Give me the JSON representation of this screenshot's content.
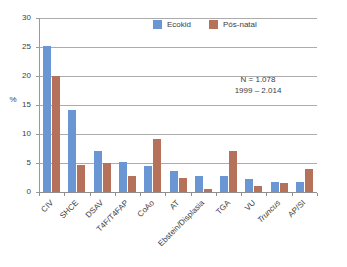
{
  "chart_data": {
    "type": "bar",
    "title": "",
    "subtitle": "",
    "xlabel": "",
    "ylabel": "%",
    "ylim": [
      0,
      30
    ],
    "yticks": [
      0,
      5,
      10,
      15,
      20,
      25,
      30
    ],
    "ytick_labels": [
      "0",
      "5",
      "10",
      "15",
      "20",
      "25",
      "30"
    ],
    "grid": true,
    "legend_position": "top-center",
    "categories": [
      "CIV",
      "SHCE",
      "DSAV",
      "T4F/T4FAP",
      "CoAo",
      "AT",
      "Ebstein/Displasia",
      "TGA",
      "VU",
      "Truncus",
      "AP/SI"
    ],
    "category_styles": [
      "normal",
      "normal",
      "normal",
      "normal",
      "normal",
      "normal",
      "normal",
      "normal",
      "normal",
      "italic",
      "normal"
    ],
    "series": [
      {
        "name": "Ecokid",
        "color": "#6a97d4",
        "values": [
          25.1,
          14.2,
          7.0,
          5.2,
          4.4,
          3.7,
          2.8,
          2.7,
          2.2,
          1.8,
          1.7
        ]
      },
      {
        "name": "Pós-natal",
        "color": "#b5715a",
        "values": [
          20.0,
          4.6,
          5.0,
          2.8,
          9.1,
          2.5,
          0.5,
          7.0,
          1.0,
          1.6,
          4.0
        ]
      }
    ],
    "annotations": [
      {
        "line1": "N = 1.078",
        "line2": "1999 – 2.014"
      }
    ]
  },
  "colors": {
    "series_blue": "#6a97d4",
    "series_brown": "#b5715a",
    "axis": "#9a9a9a",
    "grid": "#9d9d9d",
    "text": "#3d3d3d",
    "background": "#ffffff"
  }
}
